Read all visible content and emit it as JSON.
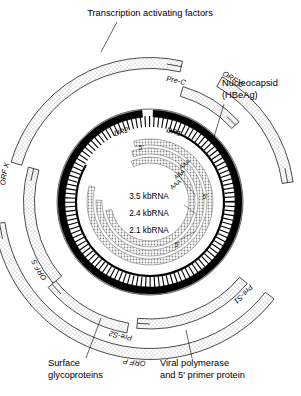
{
  "figure": {
    "type": "hbv-genome-map",
    "background": "#ffffff",
    "center": {
      "x": 150,
      "y": 202
    }
  },
  "callouts": [
    {
      "id": "transcription-factors",
      "text": "Transcription activating factors",
      "x": 150,
      "y": 16,
      "anchor": "middle",
      "leader": {
        "x1": 117,
        "y1": 22,
        "x2": 101,
        "y2": 52
      }
    },
    {
      "id": "nucleocapsid-line1",
      "text": "Nucleocapsid",
      "x": 222,
      "y": 86,
      "anchor": "start",
      "leader": {
        "x1": 224,
        "y1": 104,
        "x2": 214,
        "y2": 137
      }
    },
    {
      "id": "nucleocapsid-line2",
      "text": "(HBeAg)",
      "x": 222,
      "y": 98,
      "anchor": "start",
      "leader": null
    },
    {
      "id": "surface-glycoproteins-line1",
      "text": "Surface",
      "x": 48,
      "y": 366,
      "anchor": "start",
      "leader": {
        "x1": 86,
        "y1": 358,
        "x2": 101,
        "y2": 318
      }
    },
    {
      "id": "surface-glycoproteins-line2",
      "text": "glycoproteins",
      "x": 48,
      "y": 378,
      "anchor": "start",
      "leader": null
    },
    {
      "id": "viral-polymerase-line1",
      "text": "Viral polymerase",
      "x": 160,
      "y": 366,
      "anchor": "start",
      "leader": {
        "x1": 192,
        "y1": 358,
        "x2": 186,
        "y2": 330
      }
    },
    {
      "id": "viral-polymerase-line2",
      "text": "and 5' primer protein",
      "x": 160,
      "y": 378,
      "anchor": "start",
      "leader": null
    }
  ],
  "orf_arcs": [
    {
      "id": "orf-x",
      "label": "ORF X",
      "radius": 139,
      "start_deg": 196,
      "end_deg": 283,
      "band": 11,
      "label_deg": 205,
      "label_r": 146
    },
    {
      "id": "orf-c",
      "label": "ORF C",
      "radius": 139,
      "start_deg": 300,
      "end_deg": 352,
      "band": 11,
      "label_deg": 318,
      "label_r": 146
    },
    {
      "id": "pre-c",
      "label": "Pre-C",
      "radius": 115,
      "start_deg": 286,
      "end_deg": 318,
      "band": 10,
      "label_deg": 296,
      "label_r": 122
    },
    {
      "id": "orf-s",
      "label": "ORF S",
      "radius": 121,
      "start_deg": 140,
      "end_deg": 196,
      "band": 11,
      "label_deg": 162,
      "label_r": 128
    },
    {
      "id": "pre-s2",
      "label": "Pre-S2",
      "radius": 128,
      "start_deg": 100,
      "end_deg": 140,
      "band": 10,
      "label_deg": 116,
      "label_r": 135
    },
    {
      "id": "pre-s1",
      "label": "Pre-S1",
      "radius": 122,
      "start_deg": 40,
      "end_deg": 96,
      "band": 10,
      "label_deg": 58,
      "label_r": 129
    },
    {
      "id": "orf-p",
      "label": "ORF P",
      "radius": 152,
      "start_deg": 38,
      "end_deg": 172,
      "band": 11,
      "label_deg": 110,
      "label_r": 159
    }
  ],
  "dna": {
    "outer_strand_label_left": "DR2",
    "outer_strand_label_right": "DR1",
    "outer_radius": 92,
    "inner_radius": 74,
    "color": "#000000"
  },
  "rna_transcripts": [
    {
      "id": "rna-3-5kb",
      "label": "3.5 kbRNA",
      "radius": 60,
      "tail": "AAA",
      "five_prime": "5'"
    },
    {
      "id": "rna-2-4kb",
      "label": "2.4 kbRNA",
      "radius": 51,
      "tail": "AAA",
      "five_prime": "5'"
    },
    {
      "id": "rna-2-1kb",
      "label": "2.1 kbRNA",
      "radius": 42,
      "tail": "AAA",
      "five_prime": "5'"
    }
  ],
  "rna_labels": [
    {
      "id": "rna-label-3-5",
      "text": "3.5 kbRNA",
      "x": 149,
      "y": 199
    },
    {
      "id": "rna-label-2-4",
      "text": "2.4 kbRNA",
      "x": 149,
      "y": 216
    },
    {
      "id": "rna-label-2-1",
      "text": "2.1 kbRNA",
      "x": 149,
      "y": 233
    }
  ],
  "poly_a_tails": [
    {
      "id": "aaa-1",
      "text": "AAA",
      "x": 186,
      "y": 166
    },
    {
      "id": "aaa-2",
      "text": "AAA",
      "x": 181,
      "y": 176
    },
    {
      "id": "aaa-3",
      "text": "AAA",
      "x": 177,
      "y": 186
    }
  ],
  "five_prime_marks": [
    {
      "id": "fp-dna",
      "text": "5'",
      "x": 141,
      "y": 150
    },
    {
      "id": "fp-right",
      "text": "5'",
      "x": 205,
      "y": 199
    },
    {
      "id": "fp-bottom",
      "text": "5'",
      "x": 177,
      "y": 247
    }
  ]
}
